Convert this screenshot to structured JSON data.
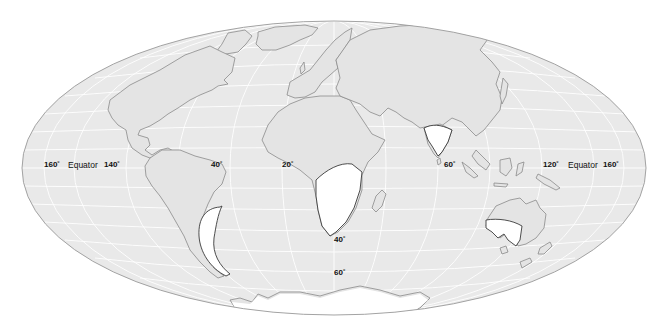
{
  "map": {
    "projection": "mollweide-like world outline",
    "colors": {
      "ocean": "#e9e9e9",
      "land": "#e4e4e4",
      "graticule": "#ffffff",
      "coast": "#8a8a8a",
      "ice_region": "#ffffff",
      "ice_margin": "#3a3a3a",
      "outline": "#9a9a9a"
    },
    "labels": {
      "left_160": "160˚",
      "left_equator": "Equator",
      "left_140": "140˚",
      "lon_40": "40˚",
      "lon_20": "20˚",
      "lon_60": "60˚",
      "right_120": "120˚",
      "right_equator": "Equator",
      "right_160": "160˚",
      "lat_40": "40˚",
      "lat_60": "60˚"
    },
    "glaciated_regions": [
      "South America (Patagonia)",
      "Southern Africa",
      "India",
      "Australia",
      "Antarctica"
    ]
  }
}
